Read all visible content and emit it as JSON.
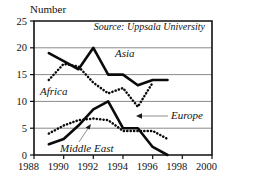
{
  "chart_data": {
    "type": "line",
    "title": "",
    "subtitle": "",
    "ylabel": "Number",
    "xlabel": "",
    "source_note": "Source: Uppsala University",
    "grid": "horizontal",
    "legend_position": "inline-annotations",
    "xlim": [
      1988,
      2000
    ],
    "ylim": [
      0,
      25
    ],
    "xticks": [
      1988,
      1990,
      1992,
      1994,
      1996,
      1998,
      2000
    ],
    "xtick_labels": [
      "1988",
      "1990",
      "1992",
      "1994",
      "1996",
      "1998",
      "2000"
    ],
    "yticks": [
      0,
      5,
      10,
      15,
      20,
      25
    ],
    "ytick_labels": [
      "0",
      "5",
      "10",
      "15",
      "20",
      "25"
    ],
    "series": [
      {
        "name": "Asia",
        "style": "solid",
        "x": [
          1989,
          1990,
          1991,
          1992,
          1993,
          1994,
          1995,
          1996,
          1997
        ],
        "values": [
          19,
          17.5,
          16,
          20,
          15,
          15,
          13,
          14,
          14
        ]
      },
      {
        "name": "Africa",
        "style": "dotted",
        "x": [
          1989,
          1990,
          1991,
          1992,
          1993,
          1994,
          1995,
          1996
        ],
        "values": [
          14,
          17,
          16.5,
          13.5,
          11.5,
          12.5,
          9,
          13.5
        ]
      },
      {
        "name": "Middle East",
        "style": "solid",
        "x": [
          1989,
          1990,
          1991,
          1992,
          1993,
          1994,
          1995,
          1996,
          1997
        ],
        "values": [
          2,
          3,
          5.5,
          8.5,
          10,
          5,
          5,
          1.5,
          0
        ]
      },
      {
        "name": "Europe",
        "style": "dotted",
        "x": [
          1989,
          1990,
          1991,
          1992,
          1993,
          1994,
          1995,
          1996,
          1997
        ],
        "values": [
          4,
          5.5,
          6.5,
          6.8,
          6.5,
          4.5,
          4.5,
          4.5,
          3
        ]
      }
    ],
    "annotations": [
      {
        "text": "Asia",
        "target_series": "Asia",
        "has_leader": false
      },
      {
        "text": "Africa",
        "target_series": "Africa",
        "has_leader": false
      },
      {
        "text": "Europe",
        "target_series": "Europe",
        "has_leader": true
      },
      {
        "text": "Middle East",
        "target_series": "Middle East",
        "has_leader": true
      }
    ],
    "colors": {
      "line": "#0b0b0b",
      "grid": "#8a8a8a",
      "frame": "#111111",
      "leader": "#8e8e8e",
      "background": "#ffffff"
    }
  }
}
